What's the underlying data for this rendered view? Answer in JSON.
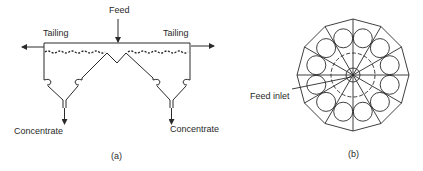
{
  "figure": {
    "panel_a": {
      "caption": "(a)",
      "labels": {
        "feed": "Feed",
        "tailing_left": "Tailing",
        "tailing_right": "Tailing",
        "concentrate_left": "Concentrate",
        "concentrate_right": "Concentrate"
      }
    },
    "panel_b": {
      "caption": "(b)",
      "labels": {
        "feed_inlet": "Feed inlet"
      },
      "sides": 12,
      "cells": 12
    },
    "colors": {
      "line": "#2a2a2a",
      "background": "#ffffff"
    }
  }
}
